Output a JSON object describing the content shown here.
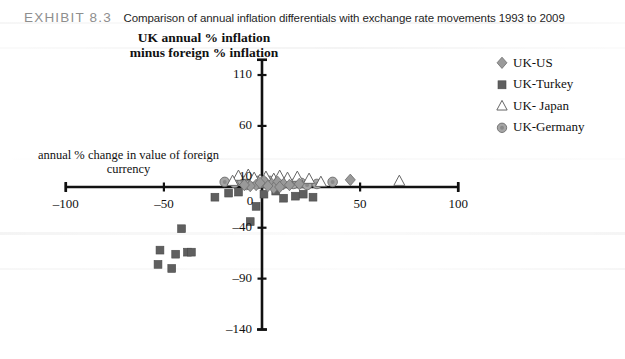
{
  "header": {
    "exhibit_label": "EXHIBIT 8.3",
    "caption": "Comparison of annual inflation differentials with exchange rate movements 1993 to 2009"
  },
  "chart_data": {
    "type": "scatter",
    "title": "Comparison of annual inflation differentials with exchange rate movements 1993 to 2009",
    "ylabel": "UK annual % inflation minus foreign % inflation",
    "xlabel": "annual % change in value of foreign currency",
    "xlim": [
      -100,
      100
    ],
    "ylim": [
      -140,
      125
    ],
    "xticks": [
      -100,
      -50,
      0,
      50,
      100
    ],
    "xtick_labels": [
      "–100",
      "–50",
      "0",
      "50",
      "100"
    ],
    "yticks": [
      110,
      60,
      10,
      -40,
      -90,
      -140
    ],
    "ytick_labels": [
      "110",
      "60",
      "10",
      "–40",
      "–90",
      "–140"
    ],
    "origin_label": "0",
    "grid": false,
    "legend_position": "top-right",
    "series": [
      {
        "name": "UK-US",
        "marker": "diamond",
        "color": "#9a9a9a",
        "edge": "#6d6d6d",
        "points": [
          [
            2,
            4
          ],
          [
            5,
            3
          ],
          [
            -3,
            2
          ],
          [
            8,
            5
          ],
          [
            -6,
            1
          ],
          [
            11,
            3
          ],
          [
            1,
            6
          ],
          [
            -9,
            2
          ],
          [
            6,
            -1
          ],
          [
            14,
            2
          ],
          [
            45,
            7
          ],
          [
            3,
            1
          ],
          [
            -1,
            4
          ],
          [
            9,
            0
          ],
          [
            19,
            3
          ]
        ]
      },
      {
        "name": "UK-Turkey",
        "marker": "square",
        "color": "#5f5f5f",
        "edge": "#4a4a4a",
        "points": [
          [
            -52,
            -62
          ],
          [
            -44,
            -66
          ],
          [
            -53,
            -76
          ],
          [
            -46,
            -80
          ],
          [
            -38,
            -64
          ],
          [
            -36,
            -64
          ],
          [
            -41,
            -41
          ],
          [
            -24,
            -10
          ],
          [
            -3,
            -19
          ],
          [
            -6,
            -34
          ],
          [
            11,
            -11
          ],
          [
            17,
            -9
          ],
          [
            26,
            -10
          ],
          [
            1,
            -7
          ],
          [
            -12,
            -5
          ],
          [
            7,
            -4
          ],
          [
            -17,
            -6
          ],
          [
            21,
            -7
          ]
        ]
      },
      {
        "name": "UK- Japan",
        "marker": "triangle",
        "color": "#ffffff",
        "edge": "#666666",
        "points": [
          [
            -12,
            11
          ],
          [
            -7,
            12
          ],
          [
            -4,
            9
          ],
          [
            2,
            10
          ],
          [
            6,
            8
          ],
          [
            13,
            9
          ],
          [
            18,
            10
          ],
          [
            24,
            8
          ],
          [
            70,
            6
          ],
          [
            -1,
            7
          ],
          [
            9,
            11
          ],
          [
            -15,
            6
          ],
          [
            30,
            5
          ]
        ]
      },
      {
        "name": "UK-Germany",
        "marker": "circle",
        "color": "#a6a6a6",
        "edge": "#6d6d6d",
        "points": [
          [
            -19,
            5
          ],
          [
            -14,
            4
          ],
          [
            -10,
            6
          ],
          [
            -5,
            5
          ],
          [
            0,
            4
          ],
          [
            4,
            6
          ],
          [
            8,
            4
          ],
          [
            12,
            5
          ],
          [
            16,
            3
          ],
          [
            20,
            4
          ],
          [
            36,
            5
          ],
          [
            -2,
            3
          ],
          [
            -8,
            2
          ],
          [
            23,
            2
          ],
          [
            28,
            3
          ]
        ]
      }
    ]
  },
  "legend": {
    "items": [
      {
        "label": "UK-US",
        "marker": "diamond-marker"
      },
      {
        "label": "UK-Turkey",
        "marker": "square-marker"
      },
      {
        "label": "UK- Japan",
        "marker": "triangle-marker"
      },
      {
        "label": "UK-Germany",
        "marker": "circle-marker"
      }
    ]
  }
}
